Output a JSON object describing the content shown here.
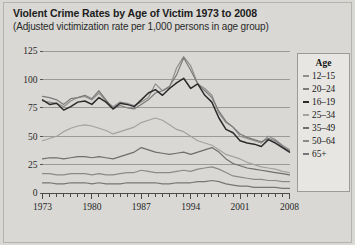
{
  "title": "Violent Crime Rates by Age of Victim 1973 to 2008",
  "subtitle": "(Adjusted victimization rate per 1,000 persons in age group)",
  "legend": {
    "heading": "Age",
    "items": [
      {
        "label": "12–15",
        "color": "#8f8f8f"
      },
      {
        "label": "20–24",
        "color": "#7b7b7b"
      },
      {
        "label": "16–19",
        "color": "#2b2b2b"
      },
      {
        "label": "25–34",
        "color": "#a2a2a2"
      },
      {
        "label": "35–49",
        "color": "#6e6e6e"
      },
      {
        "label": "50–64",
        "color": "#8a8a8a"
      },
      {
        "label": "65+",
        "color": "#767676"
      }
    ]
  },
  "chart_data": {
    "type": "line",
    "title": "Violent Crime Rates by Age of Victim 1973 to 2008",
    "subtitle": "(Adjusted victimization rate per 1,000 persons in age group)",
    "xlabel": "",
    "ylabel": "",
    "xlim": [
      1973,
      2008
    ],
    "ylim": [
      0,
      125
    ],
    "yticks": [
      0,
      25,
      50,
      75,
      100,
      125
    ],
    "ytick_labels": [
      "0",
      "25",
      "50",
      "75",
      "100",
      "125"
    ],
    "xticks": [
      1973,
      1980,
      1987,
      1994,
      2001,
      2008
    ],
    "xtick_labels": [
      "1973",
      "1980",
      "1987",
      "1994",
      "2001",
      "2008"
    ],
    "minor_xticks_every": 1,
    "grid": "horizontal",
    "legend_position": "right",
    "x": [
      1973,
      1974,
      1975,
      1976,
      1977,
      1978,
      1979,
      1980,
      1981,
      1982,
      1983,
      1984,
      1985,
      1986,
      1987,
      1988,
      1989,
      1990,
      1991,
      1992,
      1993,
      1994,
      1995,
      1996,
      1997,
      1998,
      1999,
      2000,
      2001,
      2002,
      2003,
      2004,
      2005,
      2006,
      2007,
      2008
    ],
    "series": [
      {
        "name": "12–15",
        "color": "#8f8f8f",
        "values": [
          81,
          80,
          79,
          76,
          81,
          84,
          85,
          82,
          88,
          81,
          76,
          80,
          79,
          77,
          80,
          84,
          96,
          90,
          93,
          110,
          120,
          112,
          96,
          92,
          86,
          70,
          62,
          58,
          50,
          48,
          46,
          44,
          50,
          47,
          42,
          38
        ]
      },
      {
        "name": "20–24",
        "color": "#7b7b7b",
        "values": [
          85,
          84,
          82,
          78,
          83,
          84,
          86,
          83,
          90,
          82,
          74,
          77,
          75,
          74,
          78,
          82,
          88,
          90,
          94,
          104,
          119,
          108,
          96,
          90,
          84,
          72,
          63,
          58,
          52,
          49,
          47,
          45,
          48,
          46,
          41,
          37
        ]
      },
      {
        "name": "16–19",
        "color": "#2b2b2b",
        "values": [
          82,
          78,
          79,
          73,
          76,
          80,
          81,
          78,
          84,
          80,
          74,
          79,
          78,
          76,
          82,
          88,
          91,
          86,
          92,
          97,
          101,
          92,
          96,
          86,
          80,
          66,
          56,
          53,
          46,
          44,
          43,
          41,
          47,
          44,
          40,
          36
        ]
      },
      {
        "name": "25–34",
        "color": "#a2a2a2",
        "values": [
          46,
          48,
          50,
          54,
          57,
          59,
          60,
          59,
          57,
          55,
          52,
          54,
          56,
          58,
          62,
          64,
          66,
          64,
          60,
          56,
          54,
          50,
          46,
          44,
          42,
          38,
          34,
          32,
          30,
          27,
          25,
          23,
          22,
          21,
          19,
          18
        ]
      },
      {
        "name": "35–49",
        "color": "#6e6e6e",
        "values": [
          30,
          31,
          31,
          30,
          31,
          32,
          32,
          31,
          32,
          31,
          30,
          32,
          34,
          36,
          40,
          38,
          36,
          35,
          34,
          35,
          36,
          34,
          36,
          38,
          40,
          36,
          30,
          26,
          24,
          22,
          21,
          20,
          19,
          18,
          17,
          16
        ]
      },
      {
        "name": "50–64",
        "color": "#8a8a8a",
        "values": [
          17,
          17,
          16,
          16,
          17,
          17,
          17,
          16,
          17,
          16,
          16,
          17,
          18,
          18,
          20,
          19,
          18,
          18,
          18,
          19,
          20,
          19,
          21,
          22,
          23,
          21,
          18,
          15,
          14,
          13,
          12,
          12,
          11,
          11,
          10,
          10
        ]
      },
      {
        "name": "65+",
        "color": "#767676",
        "values": [
          9,
          9,
          8,
          8,
          9,
          9,
          9,
          8,
          9,
          8,
          8,
          8,
          9,
          9,
          9,
          9,
          9,
          8,
          8,
          9,
          9,
          9,
          10,
          10,
          11,
          10,
          8,
          7,
          6,
          6,
          5,
          5,
          5,
          5,
          4,
          4
        ]
      }
    ]
  }
}
